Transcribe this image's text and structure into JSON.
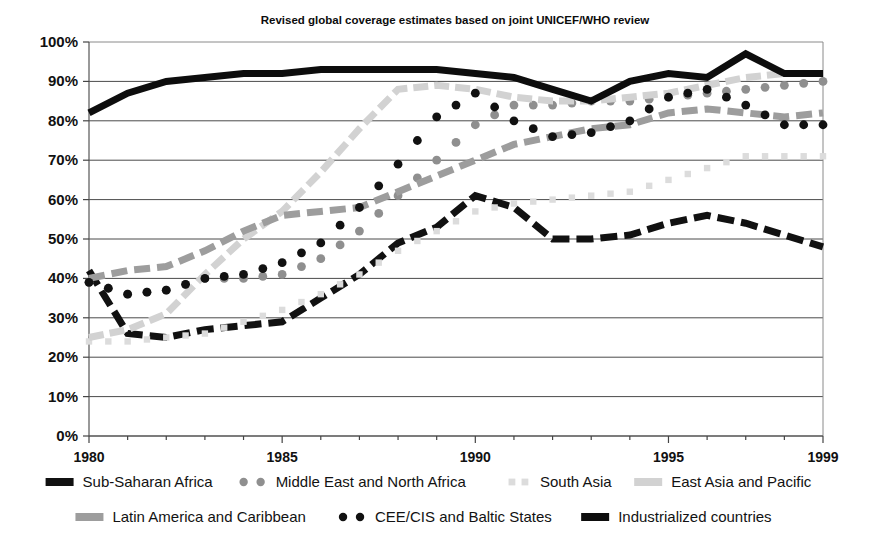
{
  "chart_data": {
    "type": "line",
    "title": "Revised global coverage estimates based on joint UNICEF/WHO review",
    "xlabel": "",
    "ylabel": "",
    "xlim": [
      1980,
      1999
    ],
    "ylim": [
      0,
      100
    ],
    "grid": true,
    "legend_position": "bottom",
    "y_ticks": [
      "0%",
      "10%",
      "20%",
      "30%",
      "40%",
      "50%",
      "60%",
      "70%",
      "80%",
      "90%",
      "100%"
    ],
    "y_tick_values": [
      0,
      10,
      20,
      30,
      40,
      50,
      60,
      70,
      80,
      90,
      100
    ],
    "x_ticks": [
      "1980",
      "1985",
      "1990",
      "1995",
      "1999"
    ],
    "x_tick_values": [
      1980,
      1985,
      1990,
      1995,
      1999
    ],
    "x": [
      1980,
      1981,
      1982,
      1983,
      1984,
      1985,
      1986,
      1987,
      1988,
      1989,
      1990,
      1991,
      1992,
      1993,
      1994,
      1995,
      1996,
      1997,
      1998,
      1999
    ],
    "series": [
      {
        "name": "Sub-Saharan Africa",
        "color": "#111111",
        "style": "thick-dash",
        "marker": "none",
        "width": 7,
        "dash": "17,7",
        "values": [
          42,
          26,
          25,
          27,
          28,
          29,
          35,
          41,
          49,
          53,
          61,
          58,
          50,
          50,
          51,
          54,
          56,
          54,
          51,
          48
        ]
      },
      {
        "name": "Middle East and North Africa",
        "color": "#8f8f8f",
        "style": "dotted",
        "marker": "circle",
        "width": 0,
        "dash": "",
        "values": [
          39,
          36,
          37,
          40,
          40,
          41,
          45,
          52,
          61,
          70,
          79,
          84,
          84,
          85,
          85,
          86,
          87,
          88,
          89,
          90
        ]
      },
      {
        "name": "South Asia",
        "color": "#dcdcdc",
        "style": "dotted-small",
        "marker": "square",
        "width": 0,
        "dash": "",
        "values": [
          24,
          24,
          25,
          26,
          29,
          32,
          36,
          41,
          47,
          52,
          57,
          59,
          60,
          61,
          62,
          65,
          68,
          71,
          71,
          71
        ]
      },
      {
        "name": "East Asia and Pacific",
        "color": "#d2d2d2",
        "style": "thick-dash",
        "marker": "none",
        "width": 7,
        "dash": "15,6",
        "values": [
          25,
          27,
          31,
          41,
          50,
          57,
          67,
          78,
          88,
          89,
          88,
          86,
          85,
          85,
          86,
          87,
          89,
          91,
          92,
          92
        ]
      },
      {
        "name": "Latin America and Caribbean",
        "color": "#9d9d9d",
        "style": "thick-dash",
        "marker": "none",
        "width": 7,
        "dash": "16,7",
        "values": [
          40,
          42,
          43,
          47,
          52,
          56,
          57,
          58,
          62,
          66,
          70,
          74,
          76,
          78,
          79,
          82,
          83,
          82,
          81,
          82
        ]
      },
      {
        "name": "CEE/CIS and Baltic States",
        "color": "#111111",
        "style": "dotted",
        "marker": "circle",
        "width": 0,
        "dash": "",
        "values": [
          39,
          36,
          37,
          40,
          41,
          44,
          49,
          58,
          69,
          81,
          87,
          80,
          76,
          77,
          80,
          86,
          88,
          84,
          79,
          79
        ]
      },
      {
        "name": "Industrialized countries",
        "color": "#0d0d0d",
        "style": "solid-thick",
        "marker": "none",
        "width": 7,
        "dash": "",
        "values": [
          82,
          87,
          90,
          91,
          92,
          92,
          93,
          93,
          93,
          93,
          92,
          91,
          88,
          85,
          90,
          92,
          91,
          97,
          92,
          92
        ]
      }
    ]
  },
  "legend": {
    "rows": [
      [
        {
          "label": "Sub-Saharan Africa",
          "key": "sub-saharan-africa"
        },
        {
          "label": "Middle East and North Africa",
          "key": "middle-east-and-north-africa"
        },
        {
          "label": "South Asia",
          "key": "south-asia"
        },
        {
          "label": "East Asia and Pacific",
          "key": "east-asia-and-pacific"
        }
      ],
      [
        {
          "label": "Latin America and Caribbean",
          "key": "latin-america-and-caribbean"
        },
        {
          "label": "CEE/CIS and Baltic States",
          "key": "cee-cis-and-baltic-states"
        },
        {
          "label": "Industrialized countries",
          "key": "industrialized-countries"
        }
      ]
    ]
  }
}
